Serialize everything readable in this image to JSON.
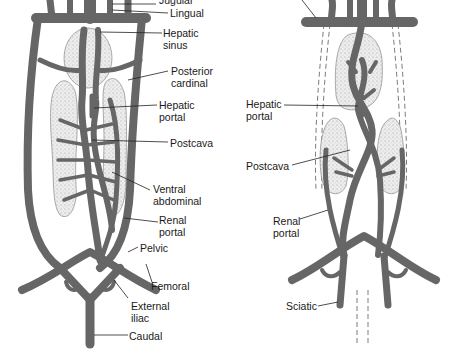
{
  "figure": {
    "panels": [
      {
        "id": "left",
        "description": "Venous system, ventral view (shark-like pattern with posterior cardinals)",
        "labels": [
          {
            "key": "jugular",
            "text": "Jugular"
          },
          {
            "key": "lingual",
            "text": "Lingual"
          },
          {
            "key": "hepatic_sinus",
            "text": "Hepatic\nsinus"
          },
          {
            "key": "posterior_cardinal",
            "text": "Posterior\ncardinal"
          },
          {
            "key": "hepatic_portal",
            "text": "Hepatic\nportal"
          },
          {
            "key": "postcava",
            "text": "Postcava"
          },
          {
            "key": "ventral_abdominal",
            "text": "Ventral\nabdominal"
          },
          {
            "key": "renal_portal",
            "text": "Renal\nportal"
          },
          {
            "key": "pelvic",
            "text": "Pelvic"
          },
          {
            "key": "femoral",
            "text": "Femoral"
          },
          {
            "key": "external_iliac",
            "text": "External\niliac"
          },
          {
            "key": "caudal",
            "text": "Caudal"
          }
        ]
      },
      {
        "id": "right",
        "description": "Venous system, reduced pattern (dashed outlines show lost posterior cardinals and caudal)",
        "labels": [
          {
            "key": "hepatic_portal",
            "text": "Hepatic\nportal"
          },
          {
            "key": "postcava",
            "text": "Postcava"
          },
          {
            "key": "renal_portal",
            "text": "Renal\nportal"
          },
          {
            "key": "sciatic",
            "text": "Sciatic"
          }
        ]
      }
    ],
    "colors": {
      "vessel": "#666666",
      "vessel_outline": "#3a3a3a",
      "organ_fill": "#e6e6e6",
      "organ_stipple": "#9a9a9a",
      "leader": "#222222",
      "text": "#1a1a1a"
    }
  }
}
